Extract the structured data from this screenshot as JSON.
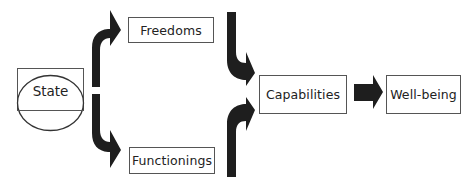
{
  "diagram": {
    "nodes": {
      "state": {
        "label": "State"
      },
      "freedoms": {
        "label": "Freedoms"
      },
      "functionings": {
        "label": "Functionings"
      },
      "capabilities": {
        "label": "Capabilities"
      },
      "wellbeing": {
        "label": "Well-being"
      }
    },
    "edges": [
      {
        "from": "State",
        "to": "Freedoms"
      },
      {
        "from": "State",
        "to": "Functionings"
      },
      {
        "from": "Freedoms",
        "to": "Capabilities"
      },
      {
        "from": "Functionings",
        "to": "Capabilities"
      },
      {
        "from": "Capabilities",
        "to": "Well-being"
      }
    ],
    "colors": {
      "arrow": "#1e1e1e",
      "border": "#555555",
      "text": "#222222"
    }
  }
}
